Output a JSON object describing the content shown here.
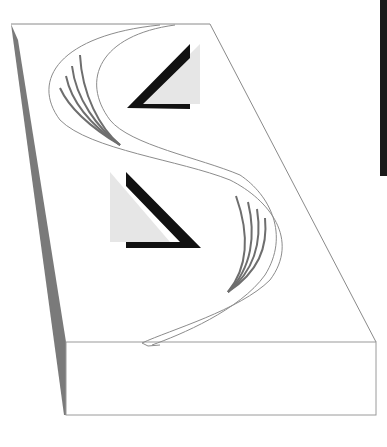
{
  "figure": {
    "colors": {
      "background": "#ffffff",
      "outline": "#8a8a8a",
      "side_face": "#7a7a7a",
      "ribbon": "#8c8c8c",
      "strands": "#6e6e6e",
      "triangle_black": "#111111",
      "triangle_gray": "#e6e6e6",
      "edge_bar": "#1a1a1a"
    }
  }
}
